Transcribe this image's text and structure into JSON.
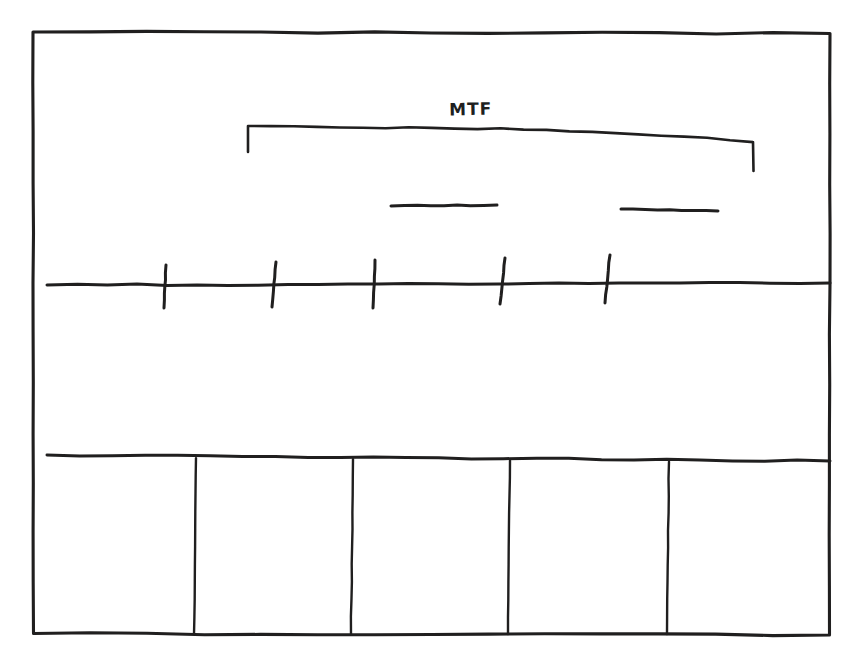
{
  "figure": {
    "kind": "hand-drawn-schematic",
    "title": "",
    "background_color": "#ffffff",
    "ink_color": "#201f1f",
    "width": 863,
    "height": 668
  },
  "frame": {
    "name": "outer-border",
    "left": 33,
    "top": 32,
    "right": 830,
    "bottom": 635
  },
  "bracket": {
    "label": "MTF",
    "label_x": 449,
    "label_y": 99,
    "span_left_x": 248,
    "span_right_x": 753,
    "top_y_left": 126,
    "top_y_right": 142,
    "apex_y": 122,
    "end_drop_left": 152,
    "end_drop_right": 171
  },
  "dashes": [
    {
      "name": "dash-left",
      "x1": 391,
      "y1": 206,
      "x2": 497,
      "y2": 205
    },
    {
      "name": "dash-right",
      "x1": 621,
      "y1": 209,
      "x2": 718,
      "y2": 211
    }
  ],
  "axis": {
    "name": "horizontal-axis",
    "x1": 47,
    "y1": 285,
    "x2": 830,
    "y2": 283,
    "tick_count": 5
  },
  "ticks": [
    {
      "name": "tick-1",
      "x_top": 166,
      "y_top": 265,
      "x_bottom": 164,
      "y_bottom": 308
    },
    {
      "name": "tick-2",
      "x_top": 276,
      "y_top": 262,
      "x_bottom": 272,
      "y_bottom": 307
    },
    {
      "name": "tick-3",
      "x_top": 375,
      "y_top": 260,
      "x_bottom": 373,
      "y_bottom": 308
    },
    {
      "name": "tick-4",
      "x_top": 505,
      "y_top": 258,
      "x_bottom": 500,
      "y_bottom": 304
    },
    {
      "name": "tick-5",
      "x_top": 610,
      "y_top": 255,
      "x_bottom": 605,
      "y_bottom": 303
    }
  ],
  "table": {
    "name": "bottom-table",
    "top_y_left": 455,
    "top_y_right": 461,
    "bottom_y": 634,
    "left_x": 47,
    "right_x": 830,
    "column_count": 5,
    "dividers": [
      {
        "name": "divider-1",
        "x_top": 196,
        "x_bottom": 194
      },
      {
        "name": "divider-2",
        "x_top": 353,
        "x_bottom": 351
      },
      {
        "name": "divider-3",
        "x_top": 510,
        "x_bottom": 508
      },
      {
        "name": "divider-4",
        "x_top": 669,
        "x_bottom": 667
      }
    ],
    "cells": [
      "",
      "",
      "",
      "",
      ""
    ]
  },
  "chart_data": {
    "type": "table",
    "title": "MTF",
    "xlabel": "",
    "ylabel": "",
    "categories": [
      "",
      "",
      "",
      "",
      ""
    ],
    "values": [
      null,
      null,
      null,
      null,
      null
    ],
    "annotations": [
      "MTF"
    ]
  }
}
